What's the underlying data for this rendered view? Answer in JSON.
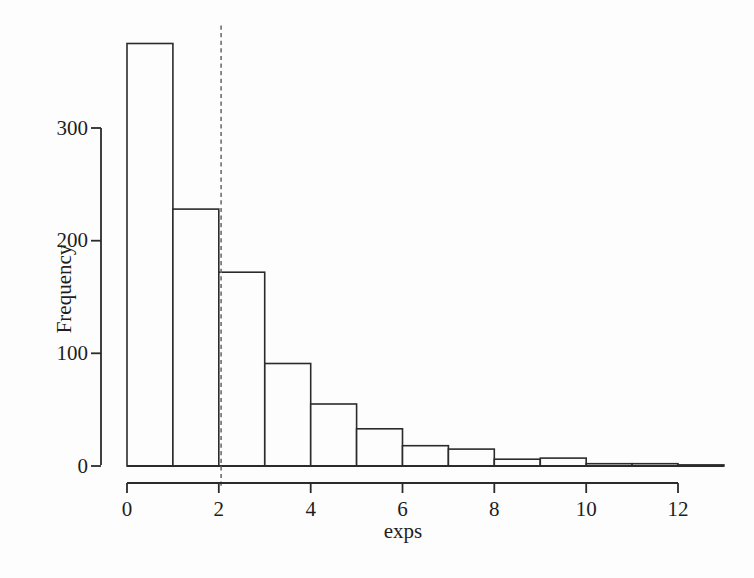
{
  "figure": {
    "background": "#fdfdfd",
    "line_color": "#2b2b2b",
    "text_color": "#1e1e1e",
    "dashed_line_color": "#6e6e6e"
  },
  "chart_data": {
    "type": "bar",
    "subtype": "histogram",
    "title": "",
    "xlabel": "exps",
    "ylabel": "Frequency",
    "bin_edges": [
      0,
      1,
      2,
      3,
      4,
      5,
      6,
      7,
      8,
      9,
      10,
      11,
      12,
      13
    ],
    "values": [
      375,
      228,
      172,
      91,
      55,
      33,
      18,
      15,
      6,
      7,
      2,
      2,
      1
    ],
    "x_ticks": [
      0,
      2,
      4,
      6,
      8,
      10,
      12
    ],
    "y_ticks": [
      0,
      100,
      200,
      300
    ],
    "xlim": [
      0,
      13
    ],
    "ylim": [
      0,
      391
    ],
    "grid": false,
    "legend": null,
    "dashed_vline_x": 2.05,
    "bar_fill": "#fdfdfd",
    "annotations": []
  }
}
